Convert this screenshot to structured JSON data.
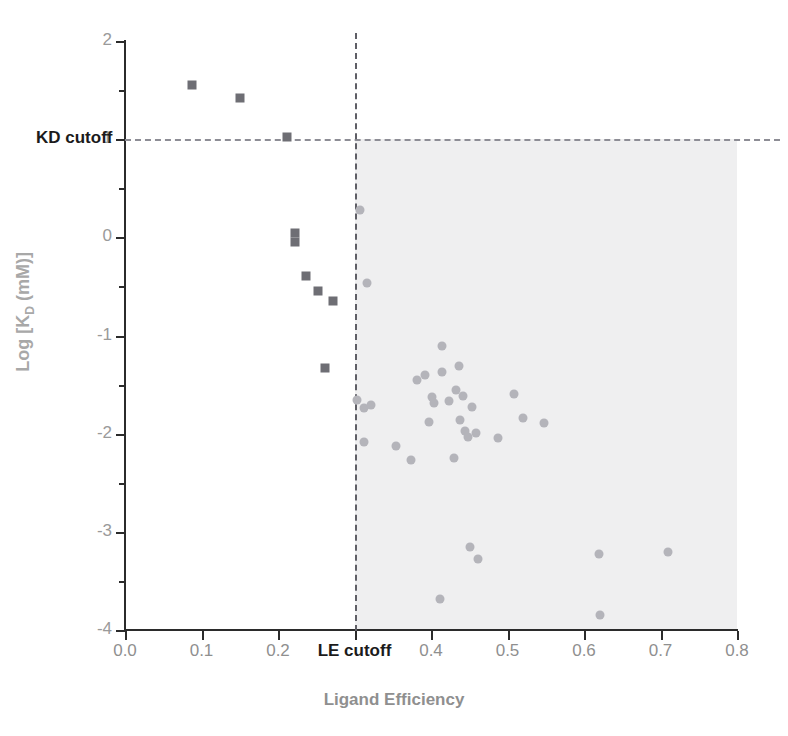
{
  "chart_data": {
    "type": "scatter",
    "title": "",
    "xlabel": "Ligand Efficiency",
    "ylabel": "Log [KD (mM)]",
    "ylabel_parts": {
      "pre": "Log [K",
      "sub": "D",
      "post": " (mM)]"
    },
    "xlim": [
      0.0,
      0.8
    ],
    "ylim": [
      -4,
      2
    ],
    "xticks": [
      "0.0",
      "0.1",
      "0.2",
      "LE  cutoff",
      "0.4",
      "0.5",
      "0.6",
      "0.7",
      "0.8"
    ],
    "xtick_values": [
      0.0,
      0.1,
      0.2,
      0.3,
      0.4,
      0.5,
      0.6,
      0.7,
      0.8
    ],
    "yticks": [
      "2",
      "1",
      "0",
      "-1",
      "-2",
      "-3",
      "-4"
    ],
    "ytick_values": [
      2,
      1,
      0,
      -1,
      -2,
      -3,
      -4
    ],
    "yminor_values": [
      1.5,
      0.5,
      -0.5,
      -1.5,
      -2.5,
      -3.5
    ],
    "grid": false,
    "legend": "none",
    "annotations": [
      {
        "name": "kd-cutoff-label",
        "text": "KD cutoff",
        "y_value": 1
      },
      {
        "name": "le-cutoff-label",
        "text": "LE  cutoff",
        "x_value": 0.3
      }
    ],
    "reference_lines": [
      {
        "name": "kd-cutoff-line",
        "orientation": "horizontal",
        "value": 1,
        "style": "dashed",
        "color": "#8d8d95"
      },
      {
        "name": "le-cutoff-line",
        "orientation": "vertical",
        "value": 0.3,
        "style": "dashed",
        "color": "#5f5f66"
      }
    ],
    "shaded_region": {
      "name": "qualified-region",
      "x_range": [
        0.3,
        0.8
      ],
      "y_range": [
        -4,
        1
      ],
      "color": "#efeff0"
    },
    "series": [
      {
        "name": "rejected-fragments",
        "marker": "square",
        "color": "#6e6e74",
        "points": [
          [
            0.088,
            1.55
          ],
          [
            0.15,
            1.42
          ],
          [
            0.212,
            1.02
          ],
          [
            0.222,
            0.04
          ],
          [
            0.222,
            -0.05
          ],
          [
            0.237,
            -0.39
          ],
          [
            0.252,
            -0.55
          ],
          [
            0.272,
            -0.65
          ],
          [
            0.262,
            -1.33
          ]
        ]
      },
      {
        "name": "qualified-fragments",
        "marker": "circle",
        "color": "#b4b4ba",
        "points": [
          [
            0.307,
            0.28
          ],
          [
            0.316,
            -0.47
          ],
          [
            0.303,
            -1.66
          ],
          [
            0.312,
            -1.74
          ],
          [
            0.322,
            -1.71
          ],
          [
            0.313,
            -2.08
          ],
          [
            0.354,
            -2.13
          ],
          [
            0.382,
            -1.45
          ],
          [
            0.392,
            -1.4
          ],
          [
            0.401,
            -1.63
          ],
          [
            0.415,
            -1.11
          ],
          [
            0.414,
            -1.37
          ],
          [
            0.404,
            -1.69
          ],
          [
            0.424,
            -1.67
          ],
          [
            0.397,
            -1.88
          ],
          [
            0.436,
            -1.31
          ],
          [
            0.433,
            -1.56
          ],
          [
            0.442,
            -1.62
          ],
          [
            0.438,
            -1.86
          ],
          [
            0.444,
            -1.97
          ],
          [
            0.43,
            -2.25
          ],
          [
            0.453,
            -1.73
          ],
          [
            0.459,
            -1.99
          ],
          [
            0.448,
            -2.03
          ],
          [
            0.374,
            -2.27
          ],
          [
            0.508,
            -1.6
          ],
          [
            0.52,
            -1.84
          ],
          [
            0.548,
            -1.89
          ],
          [
            0.487,
            -2.04
          ],
          [
            0.451,
            -3.15
          ],
          [
            0.462,
            -3.28
          ],
          [
            0.412,
            -3.68
          ],
          [
            0.619,
            -3.23
          ],
          [
            0.71,
            -3.21
          ],
          [
            0.621,
            -3.85
          ]
        ]
      }
    ]
  }
}
